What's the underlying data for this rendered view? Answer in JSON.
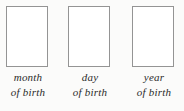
{
  "form": {
    "background_color": "#fbfbfa",
    "box_border_color": "#949494",
    "box_fill_color": "#ffffff",
    "label_color": "#2b2b2b",
    "fields": [
      {
        "name": "month-of-birth",
        "box_value": "",
        "box_placeholder": "",
        "label_line_1": "month",
        "label_line_2": "of birth"
      },
      {
        "name": "day-of-birth",
        "box_value": "",
        "box_placeholder": "",
        "label_line_1": "day",
        "label_line_2": "of birth"
      },
      {
        "name": "year-of-birth",
        "box_value": "",
        "box_placeholder": "",
        "label_line_1": "year",
        "label_line_2": "of birth"
      }
    ]
  }
}
